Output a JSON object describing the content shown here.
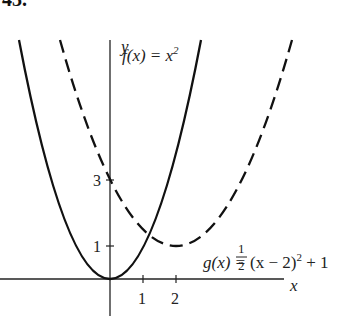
{
  "problem_number": "43.",
  "axes": {
    "x_label": "x",
    "y_label": "y",
    "x_ticks": [
      "1",
      "2"
    ],
    "y_ticks": [
      "1",
      "3"
    ]
  },
  "curves": [
    {
      "name": "f",
      "label_lhs": "f(x) = x",
      "label_exp": "2",
      "style": "solid"
    },
    {
      "name": "g",
      "label_lhs": "g(x) = ",
      "frac_num": "1",
      "frac_den": "2",
      "label_mid": "(x − 2)",
      "label_exp": "2",
      "label_tail": " + 1",
      "style": "dashed"
    }
  ]
}
